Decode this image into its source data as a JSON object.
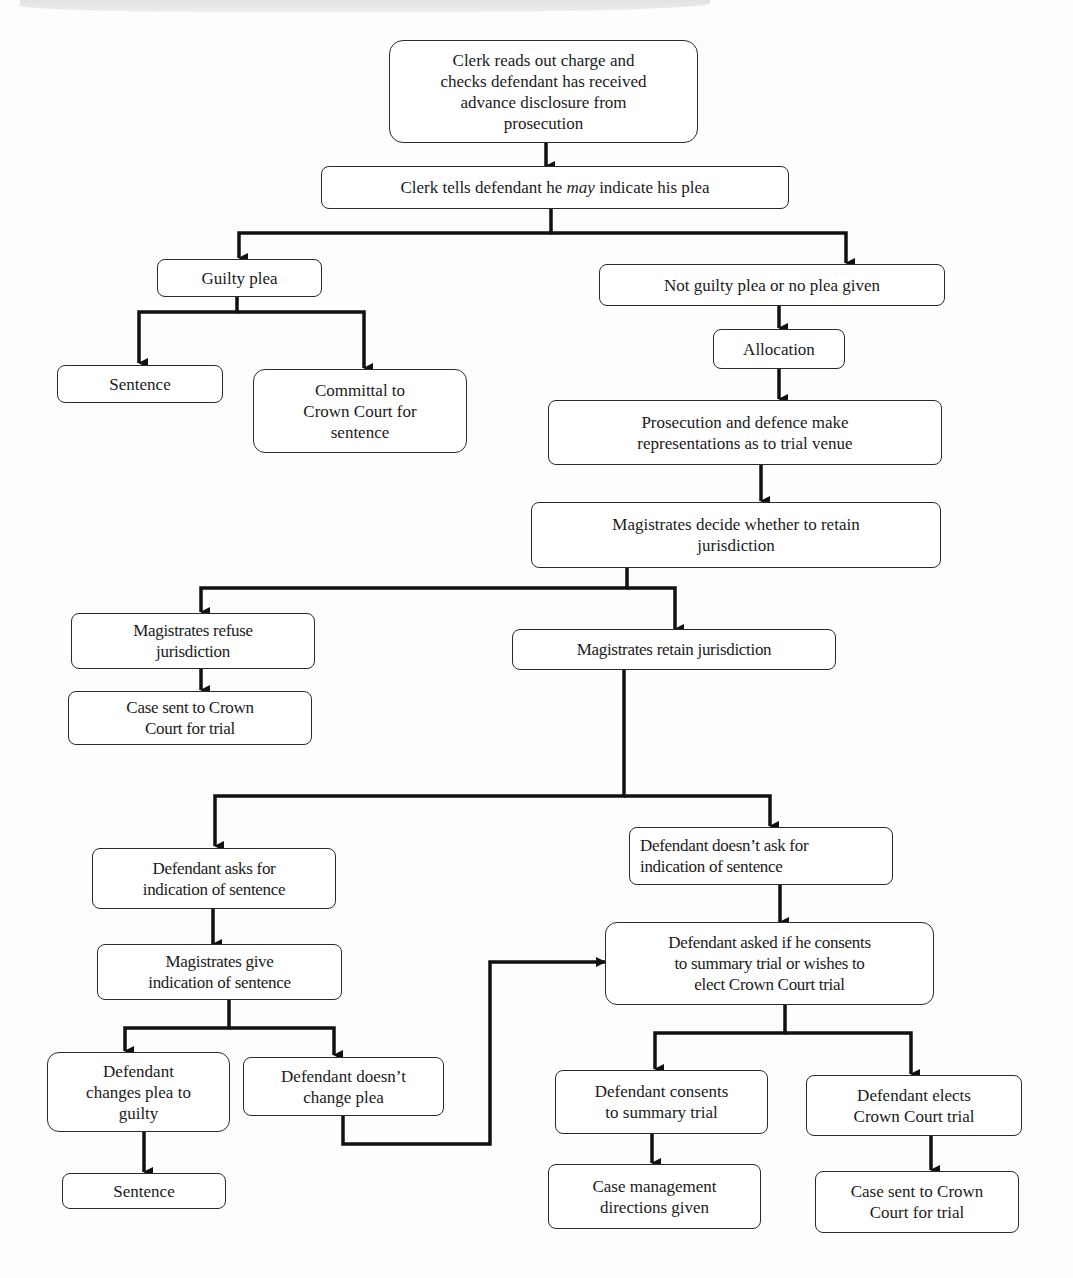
{
  "diagram": {
    "type": "flowchart",
    "title": "",
    "nodes": {
      "clerk_reads": {
        "label": "Clerk reads out charge and\nchecks defendant has received\nadvance disclosure from\nprosecution"
      },
      "clerk_tells": {
        "label_pre": "Clerk tells defendant he ",
        "label_em": "may",
        "label_post": " indicate his plea"
      },
      "guilty_plea": {
        "label": "Guilty plea"
      },
      "not_guilty": {
        "label": "Not guilty plea or no plea given"
      },
      "sentence_1": {
        "label": "Sentence"
      },
      "committal": {
        "label": "Committal to\nCrown Court for\nsentence"
      },
      "allocation": {
        "label": "Allocation"
      },
      "representations": {
        "label": "Prosecution and defence make\nrepresentations as to trial venue"
      },
      "decide_jurisdiction": {
        "label": "Magistrates decide whether to retain\njurisdiction"
      },
      "refuse_jurisdiction": {
        "label": "Magistrates refuse\njurisdiction"
      },
      "retain_jurisdiction": {
        "label": "Magistrates retain jurisdiction"
      },
      "case_sent_1": {
        "label": "Case sent to Crown\nCourt for trial"
      },
      "asks_indication": {
        "label": "Defendant asks for\nindication of sentence"
      },
      "doesnt_ask": {
        "label": "Defendant doesn’t ask for\nindication of sentence"
      },
      "give_indication": {
        "label": "Magistrates give\nindication of sentence"
      },
      "asked_consent": {
        "label": "Defendant asked if he consents\nto summary trial or wishes to\nelect Crown Court trial"
      },
      "changes_plea": {
        "label": "Defendant\nchanges plea to\nguilty"
      },
      "doesnt_change": {
        "label": "Defendant doesn’t\nchange plea"
      },
      "consents_summary": {
        "label": "Defendant consents\nto summary trial"
      },
      "elects_crown": {
        "label": "Defendant elects\nCrown Court trial"
      },
      "sentence_2": {
        "label": "Sentence"
      },
      "case_management": {
        "label": "Case management\ndirections given"
      },
      "case_sent_2": {
        "label": "Case sent to Crown\nCourt for trial"
      }
    },
    "edges": [
      [
        "clerk_reads",
        "clerk_tells"
      ],
      [
        "clerk_tells",
        "guilty_plea"
      ],
      [
        "clerk_tells",
        "not_guilty"
      ],
      [
        "guilty_plea",
        "sentence_1"
      ],
      [
        "guilty_plea",
        "committal"
      ],
      [
        "not_guilty",
        "allocation"
      ],
      [
        "allocation",
        "representations"
      ],
      [
        "representations",
        "decide_jurisdiction"
      ],
      [
        "decide_jurisdiction",
        "refuse_jurisdiction"
      ],
      [
        "decide_jurisdiction",
        "retain_jurisdiction"
      ],
      [
        "refuse_jurisdiction",
        "case_sent_1"
      ],
      [
        "retain_jurisdiction",
        "asks_indication"
      ],
      [
        "retain_jurisdiction",
        "doesnt_ask"
      ],
      [
        "asks_indication",
        "give_indication"
      ],
      [
        "give_indication",
        "changes_plea"
      ],
      [
        "give_indication",
        "doesnt_change"
      ],
      [
        "changes_plea",
        "sentence_2"
      ],
      [
        "doesnt_change",
        "asked_consent"
      ],
      [
        "doesnt_ask",
        "asked_consent"
      ],
      [
        "asked_consent",
        "consents_summary"
      ],
      [
        "asked_consent",
        "elects_crown"
      ],
      [
        "consents_summary",
        "case_management"
      ],
      [
        "elects_crown",
        "case_sent_2"
      ]
    ],
    "colors": {
      "stroke": "#1a1a1a",
      "box_fill": "#ffffff",
      "background": "#fdfdfd"
    }
  }
}
